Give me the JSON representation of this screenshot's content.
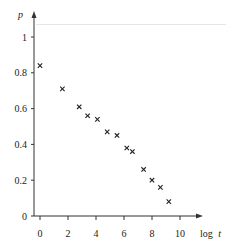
{
  "chart_data": {
    "type": "scatter",
    "title": "",
    "xlabel": "log t",
    "ylabel": "p",
    "xlim": [
      0,
      10.5
    ],
    "ylim": [
      0,
      1.05
    ],
    "xticks": [
      0,
      2,
      4,
      6,
      8,
      10
    ],
    "xtick_labels": [
      "0",
      "2",
      "4",
      "6",
      "8",
      "10"
    ],
    "yticks": [
      0,
      0.2,
      0.4,
      0.6,
      0.8,
      1
    ],
    "ytick_labels": [
      "0",
      "0.2",
      "0.4",
      "0.6",
      "0.8",
      "1"
    ],
    "grid": false,
    "legend": null,
    "marker": "x",
    "marker_color": "#222222",
    "axis_color": "#333333",
    "series": [
      {
        "name": "p",
        "points": [
          {
            "x": 0.0,
            "y": 0.84
          },
          {
            "x": 1.6,
            "y": 0.71
          },
          {
            "x": 2.8,
            "y": 0.61
          },
          {
            "x": 3.4,
            "y": 0.56
          },
          {
            "x": 4.1,
            "y": 0.54
          },
          {
            "x": 4.8,
            "y": 0.47
          },
          {
            "x": 5.5,
            "y": 0.45
          },
          {
            "x": 6.2,
            "y": 0.38
          },
          {
            "x": 6.6,
            "y": 0.36
          },
          {
            "x": 7.4,
            "y": 0.26
          },
          {
            "x": 8.0,
            "y": 0.2
          },
          {
            "x": 8.6,
            "y": 0.16
          },
          {
            "x": 9.2,
            "y": 0.08
          }
        ]
      }
    ]
  },
  "axes": {
    "x_label_prefix": "log",
    "x_label_var": "t",
    "y_label": "p"
  }
}
